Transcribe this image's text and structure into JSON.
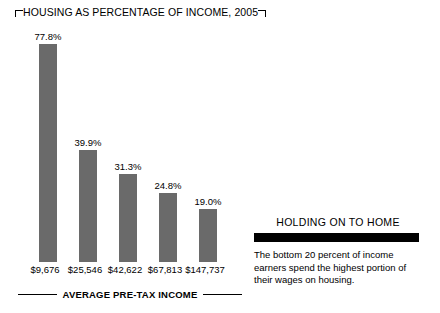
{
  "chart_data": {
    "type": "bar",
    "title": "HOUSING AS PERCENTAGE OF INCOME, 2005",
    "xlabel": "AVERAGE PRE-TAX INCOME",
    "ylabel": "",
    "categories": [
      "$9,676",
      "$25,546",
      "$42,622",
      "$67,813",
      "$147,737"
    ],
    "values": [
      77.8,
      39.9,
      31.3,
      24.8,
      19.0
    ],
    "value_labels": [
      "77.8%",
      "39.9%",
      "31.3%",
      "24.8%",
      "19.0%"
    ],
    "ylim": [
      0,
      77.8
    ],
    "grid": false,
    "legend": "none",
    "bar_color": "#6a6a6a"
  },
  "title": {
    "text": "HOUSING AS PERCENTAGE OF INCOME, 2005"
  },
  "axis": {
    "caption": "AVERAGE PRE-TAX INCOME"
  },
  "sidebar": {
    "heading": "HOLDING ON TO HOME",
    "body": "The bottom 20 percent of income earners spend the highest portion of their wages on housing."
  }
}
